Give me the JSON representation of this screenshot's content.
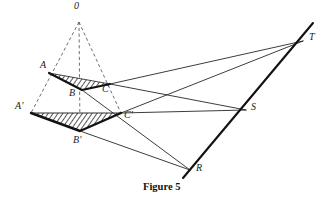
{
  "figure": {
    "caption": "Figure 5",
    "caption_position": {
      "x": 143,
      "y": 184
    },
    "colors": {
      "stroke": "#1a1a1a",
      "thick_stroke": "#111111",
      "dashed_stroke": "#555555",
      "hatch": "#222222",
      "background": "#ffffff"
    },
    "points": [
      {
        "id": "O",
        "label": "0",
        "x": 79,
        "y": 22,
        "label_x": 74,
        "label_y": 5
      },
      {
        "id": "A",
        "label": "A",
        "x": 49,
        "y": 73,
        "label_x": 40,
        "label_y": 64
      },
      {
        "id": "B",
        "label": "B",
        "x": 82,
        "y": 90,
        "label_x": 70,
        "label_y": 90
      },
      {
        "id": "C",
        "label": "C",
        "x": 110,
        "y": 84,
        "label_x": 103,
        "label_y": 86
      },
      {
        "id": "Ap",
        "label": "A'",
        "x": 31,
        "y": 113,
        "label_x": 16,
        "label_y": 104
      },
      {
        "id": "Bp",
        "label": "B'",
        "x": 80,
        "y": 131,
        "label_x": 73,
        "label_y": 136
      },
      {
        "id": "Cp",
        "label": "C'",
        "x": 121,
        "y": 113,
        "label_x": 124,
        "label_y": 112
      },
      {
        "id": "R",
        "label": "R",
        "x": 190,
        "y": 170,
        "label_x": 196,
        "label_y": 165
      },
      {
        "id": "S",
        "label": "S",
        "x": 246,
        "y": 110,
        "label_x": 251,
        "label_y": 104
      },
      {
        "id": "T",
        "label": "T",
        "x": 303,
        "y": 41,
        "label_x": 309,
        "label_y": 34
      }
    ],
    "triangles": [
      {
        "name": "upper-triangle-ABC",
        "vertices": [
          "A",
          "B",
          "C"
        ],
        "hatched": true
      },
      {
        "name": "lower-triangle-ApBpCp",
        "vertices": [
          "Ap",
          "Bp",
          "Cp"
        ],
        "hatched": true
      }
    ],
    "dashed_lines": [
      {
        "from": "O",
        "to": "Ap"
      },
      {
        "from": "O",
        "to": "Bp"
      },
      {
        "from": "O",
        "to": "Cp"
      }
    ],
    "solid_lines": [
      {
        "from": "C",
        "to": "T"
      },
      {
        "from": "C",
        "to": "S"
      },
      {
        "from": "Cp",
        "to": "T"
      },
      {
        "from": "Cp",
        "to": "S"
      },
      {
        "from": "B",
        "to": "R"
      },
      {
        "from": "Bp",
        "to": "R"
      },
      {
        "from": "Ap",
        "to": "Cp"
      },
      {
        "from": "A",
        "to": "C"
      }
    ],
    "thick_line": {
      "name": "line-R-S-T",
      "from": "R",
      "through": "S",
      "to": "T"
    }
  }
}
